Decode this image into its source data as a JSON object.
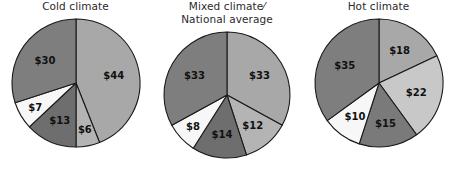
{
  "figure": {
    "background": "#ffffff",
    "label_color": "#111111",
    "outline_color": "#1a1a1a"
  },
  "chart_data": [
    {
      "type": "pie",
      "title": "Cold climate",
      "title_lines": [
        "Cold climate"
      ],
      "unit": "$",
      "categories": [
        "$44",
        "$6",
        "$13",
        "$7",
        "$30"
      ],
      "values": [
        44,
        6,
        13,
        7,
        30
      ],
      "labels": [
        "$44",
        "$6",
        "$13",
        "$7",
        "$30"
      ],
      "colors": [
        "#a8a8a8",
        "#b4b4b4",
        "#6e6e6e",
        "#f7f7f7",
        "#7e7e7e"
      ],
      "start_angle": 0,
      "direction": "clockwise",
      "legend": "none",
      "grid": false,
      "center": {
        "x": 85,
        "y": 115
      },
      "radius": 63
    },
    {
      "type": "pie",
      "title": "Mixed climate/ National average",
      "title_lines": [
        "Mixed climate⁄",
        "National average"
      ],
      "unit": "$",
      "categories": [
        "$33",
        "$12",
        "$14",
        "$8",
        "$33"
      ],
      "values": [
        33,
        12,
        14,
        8,
        33
      ],
      "labels": [
        "$33",
        "$12",
        "$14",
        "$8",
        "$33"
      ],
      "colors": [
        "#a8a8a8",
        "#b4b4b4",
        "#6e6e6e",
        "#f7f7f7",
        "#7e7e7e"
      ],
      "start_angle": 0,
      "direction": "clockwise",
      "legend": "none",
      "grid": false,
      "center": {
        "x": 229,
        "y": 120
      },
      "radius": 62
    },
    {
      "type": "pie",
      "title": "Hot climate",
      "title_lines": [
        "Hot climate"
      ],
      "unit": "$",
      "categories": [
        "$18",
        "$22",
        "$15",
        "$10",
        "$35"
      ],
      "values": [
        18,
        22,
        15,
        10,
        35
      ],
      "labels": [
        "$18",
        "$22",
        "$15",
        "$10",
        "$35"
      ],
      "colors": [
        "#a8a8a8",
        "#c8c8c8",
        "#7a7a7a",
        "#f7f7f7",
        "#7e7e7e"
      ],
      "start_angle": 0,
      "direction": "clockwise",
      "legend": "none",
      "grid": false,
      "center": {
        "x": 372,
        "y": 115
      },
      "radius": 63
    }
  ]
}
